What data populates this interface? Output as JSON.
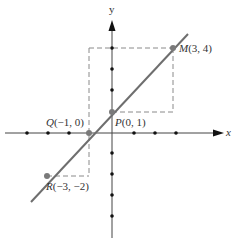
{
  "diagram": {
    "axes": {
      "x_label": "x",
      "y_label": "y"
    },
    "points": {
      "M": {
        "name": "M",
        "coords": "(3, 4)"
      },
      "P": {
        "name": "P",
        "coords": "(0, 1)"
      },
      "Q": {
        "name": "Q",
        "coords": "(−1, 0)"
      },
      "R": {
        "name": "R",
        "coords": "(−3, −2)"
      }
    },
    "colors": {
      "line": "#6e6e6e",
      "axis": "#333333",
      "dash": "#888888",
      "point": "#7a7a7a",
      "tick": "#111111"
    }
  }
}
